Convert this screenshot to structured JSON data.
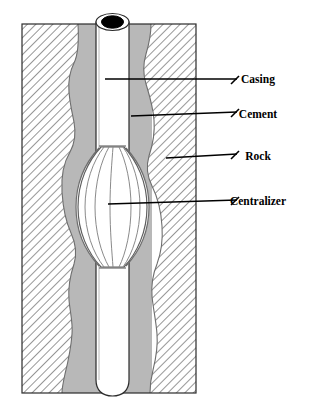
{
  "figure": {
    "background_color": "#ffffff",
    "canvas": {
      "width": 318,
      "height": 412
    }
  },
  "colors": {
    "rock_hatch_line": "#4a4a4a",
    "rock_fill": "#ffffff",
    "cement_fill": "#b8b8b8",
    "casing_fill": "#ffffff",
    "casing_bore": "#000000",
    "outline": "#2b2b2b",
    "centralizer_fill": "#ffffff",
    "centralizer_line": "#6e6e6e",
    "leader_line": "#000000",
    "label_text": "#000000"
  },
  "labels": [
    {
      "id": "casing",
      "text": "Casing",
      "x": 258,
      "y": 82,
      "leader_start_x": 105,
      "leader_start_y": 79,
      "leader_end_x": 237,
      "leader_end_y": 79
    },
    {
      "id": "cement",
      "text": "Cement",
      "x": 258,
      "y": 117,
      "leader_start_x": 131,
      "leader_start_y": 116,
      "leader_end_x": 237,
      "leader_end_y": 112
    },
    {
      "id": "rock",
      "text": "Rock",
      "x": 258,
      "y": 159,
      "leader_start_x": 166,
      "leader_start_y": 158,
      "leader_end_x": 237,
      "leader_end_y": 154
    },
    {
      "id": "centralizer",
      "text": "Centralizer",
      "x": 258,
      "y": 204,
      "leader_start_x": 108,
      "leader_start_y": 204,
      "leader_end_x": 237,
      "leader_end_y": 200
    }
  ],
  "components": {
    "rock": {
      "name": "Rock",
      "pattern": "diagonal-hatch",
      "hatch_angle_deg": 45,
      "hatch_spacing_px": 6
    },
    "cement": {
      "name": "Cement",
      "pattern": "solid-gray"
    },
    "casing": {
      "name": "Casing",
      "outer_left_x": 96,
      "outer_right_x": 129,
      "top_y": 12,
      "bottom_y": 396
    },
    "casing_bore": {
      "name": "Casing bore",
      "cx": 112,
      "cy": 22,
      "rx": 11,
      "ry": 6.5
    },
    "centralizer": {
      "name": "Centralizer",
      "type": "bow-spring",
      "blade_count": 6,
      "top_y": 146,
      "bottom_y": 268,
      "max_width_px": 76
    }
  }
}
